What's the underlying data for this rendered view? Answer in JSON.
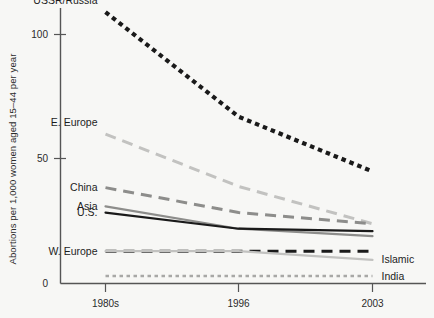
{
  "chart_data": {
    "type": "line",
    "title": "",
    "xlabel": "",
    "ylabel": "Abortions per 1,000 women aged 15–44 per year",
    "categories": [
      "1980s",
      "1996",
      "2003"
    ],
    "x_tick_labels": [
      "1980s",
      "1996",
      "2003"
    ],
    "y_tick_labels": [
      "0",
      "50",
      "100"
    ],
    "y_ticks": [
      0,
      50,
      100
    ],
    "ylim": [
      0,
      118
    ],
    "grid": false,
    "legend": "inline-labels",
    "series": [
      {
        "name": "USSR/Russia",
        "label": "USSR/Russia",
        "values": [
          109,
          67,
          45
        ],
        "color": "#1a1a1a",
        "style": "dotted-heavy",
        "label_side": "left"
      },
      {
        "name": "E. Europe",
        "label": "E. Europe",
        "values": [
          60,
          39,
          24
        ],
        "color": "#c2c2c0",
        "style": "dashed",
        "label_side": "left"
      },
      {
        "name": "China",
        "label": "China",
        "values": [
          38.5,
          28.5,
          24
        ],
        "color": "#8d8d8b",
        "style": "dashed",
        "label_side": "left"
      },
      {
        "name": "Asia",
        "label": "Asia",
        "values": [
          31,
          22,
          19
        ],
        "color": "#8d8d8b",
        "style": "solid",
        "label_side": "left"
      },
      {
        "name": "U.S.",
        "label": "U.S.",
        "values": [
          28.5,
          22,
          21
        ],
        "color": "#1a1a1a",
        "style": "solid",
        "label_side": "left"
      },
      {
        "name": "W. Europe",
        "label": "W. Europe",
        "values": [
          13,
          13,
          13
        ],
        "color": "#1a1a1a",
        "style": "dashed",
        "label_side": "left"
      },
      {
        "name": "Islamic",
        "label": "Islamic",
        "values": [
          13,
          13,
          9.5
        ],
        "color": "#c2c2c0",
        "style": "solid",
        "label_side": "right"
      },
      {
        "name": "India",
        "label": "India",
        "values": [
          3,
          3,
          3
        ],
        "color": "#a8a8a6",
        "style": "dotted",
        "label_side": "right"
      }
    ]
  },
  "colors": {
    "background": "#f7f7f5",
    "axis": "#4a4a4a",
    "text": "#1d1d1d"
  }
}
